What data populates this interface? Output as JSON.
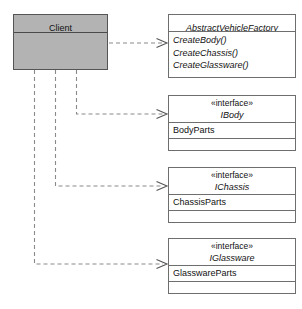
{
  "diagram": {
    "canvas": {
      "width": 302,
      "height": 309,
      "background": "#ffffff"
    },
    "colors": {
      "client_fill": "#b3b3b3",
      "box_fill": "#ffffff",
      "box_border": "#6e6e6e",
      "edge": "#8a8a8a",
      "text": "#111111"
    }
  },
  "nodes": {
    "client": {
      "name": "Client",
      "stereotype": "",
      "members": [],
      "filled": true
    },
    "abstract_factory": {
      "name": "AbstractVehicleFactory",
      "stereotype": "",
      "methods": [
        "CreateBody()",
        "CreateChassis()",
        "CreateGlassware()"
      ]
    },
    "ibody": {
      "stereotype": "«interface»",
      "name": "IBody",
      "attributes": [
        "BodyParts"
      ],
      "operations": []
    },
    "ichassis": {
      "stereotype": "«interface»",
      "name": "IChassis",
      "attributes": [
        "ChassisParts"
      ],
      "operations": []
    },
    "iglassware": {
      "stereotype": "«interface»",
      "name": "IGlassware",
      "attributes": [
        "GlasswareParts"
      ],
      "operations": []
    }
  },
  "edges": [
    {
      "id": "client-to-abstract-factory",
      "from": "Client",
      "to": "AbstractVehicleFactory",
      "kind": "dependency",
      "style": "dashed",
      "arrow": "open"
    },
    {
      "id": "client-to-ibody",
      "from": "Client",
      "to": "IBody",
      "kind": "dependency",
      "style": "dashed",
      "arrow": "open"
    },
    {
      "id": "client-to-ichassis",
      "from": "Client",
      "to": "IChassis",
      "kind": "dependency",
      "style": "dashed",
      "arrow": "open"
    },
    {
      "id": "client-to-iglassware",
      "from": "Client",
      "to": "IGlassware",
      "kind": "dependency",
      "style": "dashed",
      "arrow": "open"
    }
  ]
}
